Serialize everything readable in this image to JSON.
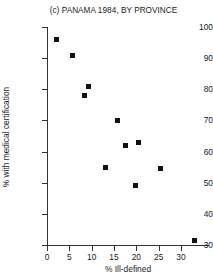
{
  "chart_data": {
    "type": "scatter",
    "title": "(c) PANAMA 1984, BY PROVINCE",
    "xlabel": "% Ill-defined",
    "ylabel": "% with medical certification",
    "xlim": [
      0,
      33.5
    ],
    "ylim": [
      30,
      100
    ],
    "xticks": [
      0,
      5,
      10,
      15,
      20,
      25,
      30
    ],
    "yticks": [
      30,
      40,
      50,
      60,
      70,
      80,
      90,
      100
    ],
    "grid": false,
    "legend": null,
    "marker": "filled-square",
    "marker_color": "#111111",
    "points": [
      {
        "x": 2.2,
        "y": 96.0
      },
      {
        "x": 5.6,
        "y": 91.0
      },
      {
        "x": 9.2,
        "y": 81.0
      },
      {
        "x": 8.5,
        "y": 78.0
      },
      {
        "x": 13.0,
        "y": 55.0
      },
      {
        "x": 15.8,
        "y": 70.0
      },
      {
        "x": 17.6,
        "y": 62.0
      },
      {
        "x": 20.5,
        "y": 63.0
      },
      {
        "x": 19.9,
        "y": 49.0
      },
      {
        "x": 25.4,
        "y": 54.5
      },
      {
        "x": 33.0,
        "y": 31.5
      }
    ]
  }
}
